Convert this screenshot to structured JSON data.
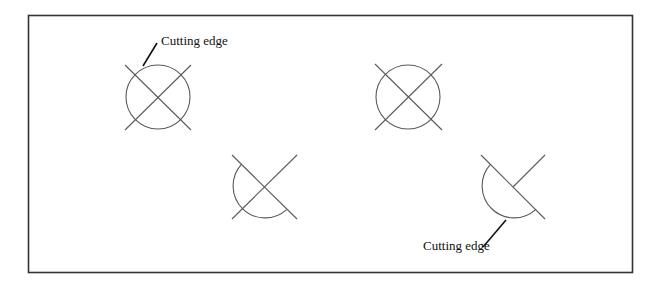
{
  "diagram": {
    "colors": {
      "frame": "#333333",
      "geometry": "#5a5a5a",
      "text": "#111111",
      "background": "#ffffff"
    },
    "labels": {
      "cutting_edge_top": "Cutting edge",
      "cutting_edge_bottom": "Cutting edge"
    },
    "panels": [
      {
        "id": "example-1-before",
        "shape": "circle crossed by two diagonal lines"
      },
      {
        "id": "example-1-after",
        "shape": "semicircle remaining after trim, both lines intact"
      },
      {
        "id": "example-2-before",
        "shape": "circle crossed by two diagonal lines"
      },
      {
        "id": "example-2-after",
        "shape": "semicircle remaining after trim, one line trimmed"
      }
    ]
  }
}
